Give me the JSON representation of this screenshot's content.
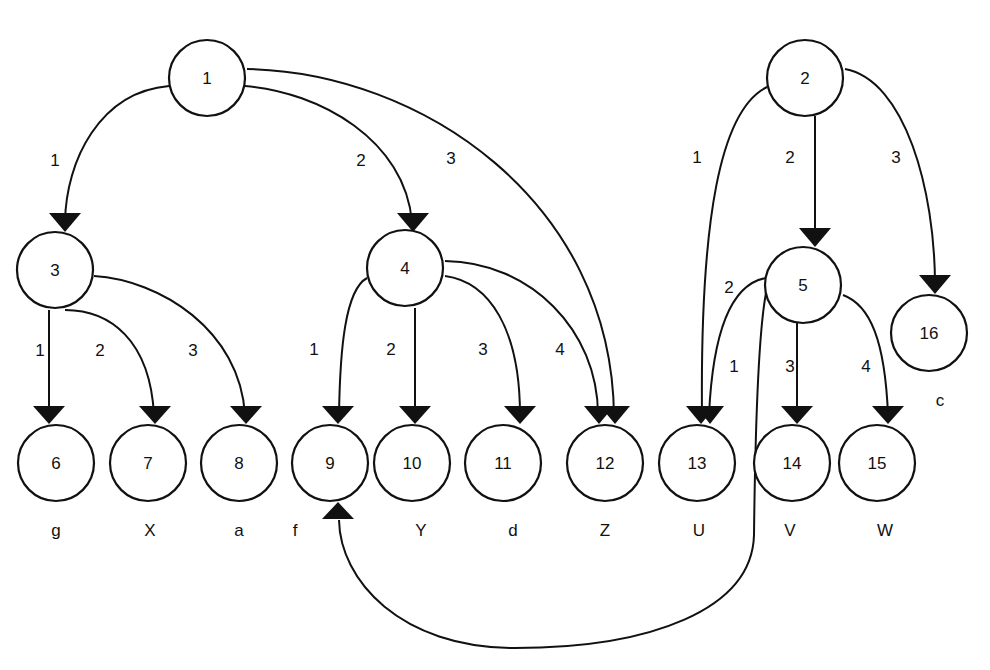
{
  "diagram": {
    "type": "directed-tree-graph",
    "nodes": [
      {
        "id": "1",
        "label": "1",
        "x": 207,
        "y": 78
      },
      {
        "id": "2",
        "label": "2",
        "x": 805,
        "y": 78
      },
      {
        "id": "3",
        "label": "3",
        "x": 55,
        "y": 270
      },
      {
        "id": "4",
        "label": "4",
        "x": 405,
        "y": 268
      },
      {
        "id": "5",
        "label": "5",
        "x": 803,
        "y": 285
      },
      {
        "id": "16",
        "label": "16",
        "x": 929,
        "y": 333
      },
      {
        "id": "6",
        "label": "6",
        "x": 56,
        "y": 463
      },
      {
        "id": "7",
        "label": "7",
        "x": 148,
        "y": 463
      },
      {
        "id": "8",
        "label": "8",
        "x": 239,
        "y": 463
      },
      {
        "id": "9",
        "label": "9",
        "x": 330,
        "y": 463
      },
      {
        "id": "10",
        "label": "10",
        "x": 412,
        "y": 463
      },
      {
        "id": "11",
        "label": "11",
        "x": 503,
        "y": 463
      },
      {
        "id": "12",
        "label": "12",
        "x": 605,
        "y": 463
      },
      {
        "id": "13",
        "label": "13",
        "x": 697,
        "y": 463
      },
      {
        "id": "14",
        "label": "14",
        "x": 792,
        "y": 463
      },
      {
        "id": "15",
        "label": "15",
        "x": 877,
        "y": 463
      }
    ],
    "edges": [
      {
        "from": "1",
        "to": "3",
        "label": "1",
        "label_x": 55,
        "label_y": 160
      },
      {
        "from": "1",
        "to": "4",
        "label": "2",
        "label_x": 361,
        "label_y": 160
      },
      {
        "from": "1",
        "to": "12",
        "label": "3",
        "label_x": 451,
        "label_y": 158
      },
      {
        "from": "2",
        "to": "13",
        "label": "1",
        "label_x": 697,
        "label_y": 157
      },
      {
        "from": "2",
        "to": "5",
        "label": "2",
        "label_x": 790,
        "label_y": 157
      },
      {
        "from": "2",
        "to": "16",
        "label": "3",
        "label_x": 896,
        "label_y": 157
      },
      {
        "from": "3",
        "to": "6",
        "label": "1",
        "label_x": 40,
        "label_y": 350
      },
      {
        "from": "3",
        "to": "7",
        "label": "2",
        "label_x": 100,
        "label_y": 350
      },
      {
        "from": "3",
        "to": "8",
        "label": "3",
        "label_x": 193,
        "label_y": 350
      },
      {
        "from": "4",
        "to": "9",
        "label": "1",
        "label_x": 314,
        "label_y": 349
      },
      {
        "from": "4",
        "to": "10",
        "label": "2",
        "label_x": 391,
        "label_y": 349
      },
      {
        "from": "4",
        "to": "11",
        "label": "3",
        "label_x": 483,
        "label_y": 349
      },
      {
        "from": "4",
        "to": "12",
        "label": "4",
        "label_x": 560,
        "label_y": 349
      },
      {
        "from": "5",
        "to": "13",
        "label": "2",
        "label_x": 729,
        "label_y": 287
      },
      {
        "from": "5",
        "to": "9",
        "label": "1",
        "label_x": 734,
        "label_y": 366
      },
      {
        "from": "5",
        "to": "14",
        "label": "3",
        "label_x": 790,
        "label_y": 366
      },
      {
        "from": "5",
        "to": "15",
        "label": "4",
        "label_x": 866,
        "label_y": 366
      }
    ],
    "leaf_labels": [
      {
        "node": "6",
        "text": "g",
        "x": 56,
        "y": 530
      },
      {
        "node": "7",
        "text": "X",
        "x": 150,
        "y": 530
      },
      {
        "node": "8",
        "text": "a",
        "x": 239,
        "y": 530
      },
      {
        "node": "9",
        "text": "f",
        "x": 295,
        "y": 530
      },
      {
        "node": "10",
        "text": "Y",
        "x": 421,
        "y": 530
      },
      {
        "node": "11",
        "text": "d",
        "x": 513,
        "y": 530
      },
      {
        "node": "12",
        "text": "Z",
        "x": 605,
        "y": 530
      },
      {
        "node": "13",
        "text": "U",
        "x": 699,
        "y": 530
      },
      {
        "node": "14",
        "text": "V",
        "x": 790,
        "y": 530
      },
      {
        "node": "15",
        "text": "W",
        "x": 885,
        "y": 530
      },
      {
        "node": "16",
        "text": "c",
        "x": 940,
        "y": 400
      }
    ]
  }
}
